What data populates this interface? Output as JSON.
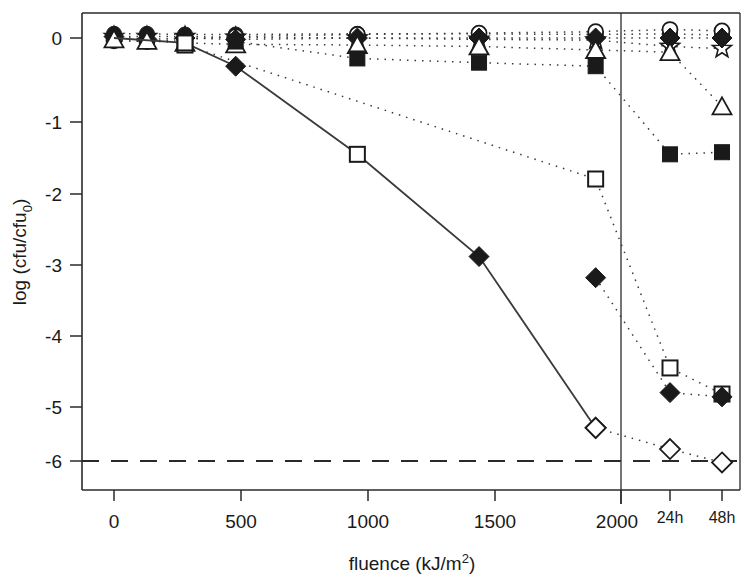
{
  "chart_data": {
    "type": "scatter",
    "title": "",
    "xlabel": "fluence (kJ/m2)",
    "xlabel_main": "fluence (kJ/m",
    "xlabel_sup": "2",
    "xlabel_tail": ")",
    "ylabel": "log (cfu/cfu0)",
    "ylabel_main": "log (cfu/cfu",
    "ylabel_sub": "0",
    "ylabel_tail": ")",
    "xlim": [
      -80,
      2000
    ],
    "ylim": [
      -6.45,
      0.45
    ],
    "grid": false,
    "legend": "none",
    "x_tick_labels": [
      "0",
      "500",
      "1000",
      "1500",
      "2000"
    ],
    "x_tick_values": [
      0,
      500,
      1000,
      1500,
      2000
    ],
    "x_extra_tick_labels": [
      "24h",
      "48h"
    ],
    "y_tick_labels": [
      "0",
      "-1",
      "-2",
      "-3",
      "-4",
      "-5",
      "-6"
    ],
    "y_tick_values": [
      0,
      -1,
      -2,
      -3,
      -4,
      -5,
      -6
    ],
    "detection_limit": -6.0,
    "detection_limit_style": "dashed",
    "panel_divider_at": 2000,
    "series": [
      {
        "name": "open-star",
        "marker": "star-open",
        "line": "dotted",
        "x": [
          0,
          130,
          280,
          480,
          960,
          1440,
          1900,
          2120,
          2260
        ],
        "y": [
          0.02,
          0.02,
          0.02,
          0.01,
          0.0,
          -0.02,
          -0.03,
          -0.12,
          -0.15
        ]
      },
      {
        "name": "filled-circle",
        "marker": "circle-filled",
        "line": "dotted",
        "x": [
          0,
          130,
          280,
          480,
          960,
          1440,
          1900,
          2120,
          2260
        ],
        "y": [
          0.06,
          0.06,
          0.05,
          0.05,
          0.06,
          0.06,
          0.05,
          0.06,
          0.04
        ]
      },
      {
        "name": "open-circle",
        "marker": "circle-open",
        "line": "dotted",
        "x": [
          0,
          130,
          280,
          480,
          960,
          1440,
          1900,
          2120,
          2260
        ],
        "y": [
          -0.04,
          -0.05,
          -0.02,
          0.02,
          0.05,
          0.07,
          0.09,
          0.12,
          0.1
        ]
      },
      {
        "name": "filled-diamond-upper",
        "marker": "diamond-filled",
        "line": "dotted",
        "x": [
          0,
          130,
          280,
          480,
          960,
          1440,
          1900,
          2120,
          2260
        ],
        "y": [
          0.02,
          -0.02,
          0.0,
          -0.02,
          0.0,
          0.0,
          0.0,
          0.0,
          0.0
        ]
      },
      {
        "name": "open-triangle",
        "marker": "triangle-open",
        "line": "dotted",
        "x": [
          0,
          130,
          280,
          480,
          960,
          1440,
          1900,
          2120,
          2260
        ],
        "y": [
          -0.02,
          -0.04,
          -0.07,
          -0.09,
          -0.1,
          -0.12,
          -0.17,
          -0.2,
          -0.97
        ]
      },
      {
        "name": "filled-square",
        "marker": "square-filled",
        "line": "dotted",
        "x": [
          480,
          960,
          1440,
          1900,
          2120,
          2260
        ],
        "y": [
          -0.05,
          -0.29,
          -0.35,
          -0.4,
          -1.65,
          -1.62
        ]
      },
      {
        "name": "open-square",
        "marker": "square-open",
        "line": "dotted",
        "x": [
          280,
          1900,
          2120,
          2260
        ],
        "y": [
          -0.1,
          -2.0,
          -4.68,
          -5.05
        ]
      },
      {
        "name": "filled-diamond-lower",
        "marker": "diamond-filled",
        "line": "dotted",
        "x": [
          1900,
          2120,
          2260
        ],
        "y": [
          -3.4,
          -5.03,
          -5.09
        ]
      },
      {
        "name": "open-diamond",
        "marker": "diamond-open",
        "line": "dotted",
        "x": [
          1900,
          2120,
          2260
        ],
        "y": [
          -5.53,
          -5.83,
          -6.02
        ]
      },
      {
        "name": "solid-line-series",
        "marker": "mixed",
        "line": "solid",
        "x": [
          0,
          280,
          480,
          960,
          1440,
          1900
        ],
        "y": [
          0.0,
          -0.07,
          -0.4,
          -1.65,
          -3.1,
          -5.53
        ],
        "markers": [
          "none",
          "square-open",
          "diamond-filled",
          "square-open",
          "diamond-filled",
          "diamond-open"
        ]
      }
    ]
  }
}
